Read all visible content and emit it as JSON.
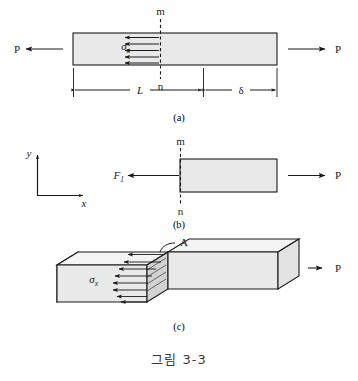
{
  "figure": {
    "caption": "그림 3-3",
    "panels": [
      {
        "id": "a",
        "label": "(a)",
        "description": "prismatic bar in tension with internal normal stress distribution on section mn",
        "left_force_label": "P",
        "right_force_label": "P",
        "section_top_label": "m",
        "section_bottom_label": "n",
        "stress_label": "σ",
        "stress_subscript": "x",
        "dimension_length_label": "L",
        "dimension_elongation_label": "δ",
        "stress_arrow_count": 5
      },
      {
        "id": "b",
        "label": "(b)",
        "description": "free body diagram of right portion of bar cut at section mn",
        "internal_force_label": "F",
        "internal_force_subscript": "1",
        "right_force_label": "P",
        "section_top_label": "m",
        "section_bottom_label": "n",
        "axis_y_label": "y",
        "axis_x_label": "x"
      },
      {
        "id": "c",
        "label": "(c)",
        "description": "three dimensional view of bar showing uniform normal stress acting over cross sectional area A",
        "area_label": "A",
        "stress_label": "σ",
        "stress_subscript": "x",
        "right_force_label": "P",
        "stress_arrow_count": 8
      }
    ]
  },
  "colors": {
    "bar_fill": "#e9e9e9",
    "bar_top_face": "#f3f3f3",
    "bar_end_face": "#bdbdbd",
    "section_face": "#d2d2d2",
    "line": "#1a1a1a",
    "caption_text": "#3a3a3a",
    "background": "#ffffff"
  }
}
